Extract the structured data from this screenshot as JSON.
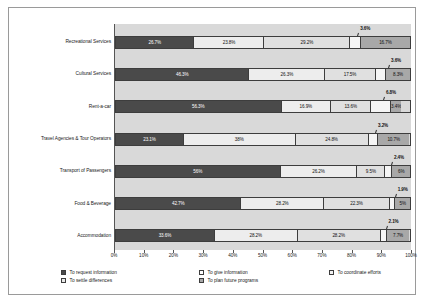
{
  "chart_data": {
    "type": "bar",
    "orientation": "horizontal",
    "stacked": true,
    "title": "",
    "xlabel": "",
    "ylabel": "",
    "xlim": [
      0,
      100
    ],
    "grid": false,
    "legend_position": "bottom",
    "axis_ticks": [
      "0%",
      "10%",
      "20%",
      "30%",
      "40%",
      "50%",
      "60%",
      "70%",
      "80%",
      "90%",
      "100%"
    ],
    "tick_values": [
      0,
      10,
      20,
      30,
      40,
      50,
      60,
      70,
      80,
      90,
      100
    ],
    "categories": [
      "Recreational Services",
      "Cultural Services",
      "Rent-a-car",
      "Travel Agencies & Tour Operators",
      "Transport of Passengers",
      "Food & Beverage",
      "Accommodation"
    ],
    "series": [
      {
        "name": "To request information",
        "color": "#4a4a4a",
        "values": [
          26.7,
          46.3,
          56.3,
          23.1,
          56.0,
          42.7,
          33.6
        ],
        "labels": [
          "26.7%",
          "46.3%",
          "56.3%",
          "23.1%",
          "56%",
          "42.7%",
          "33.6%"
        ]
      },
      {
        "name": "To give information",
        "color": "#ededed",
        "values": [
          23.8,
          26.3,
          16.9,
          38.0,
          26.2,
          28.2,
          28.2
        ],
        "labels": [
          "23.8%",
          "26.3%",
          "16.9%",
          "38%",
          "26.2%",
          "28.2%",
          "28.2%"
        ]
      },
      {
        "name": "To coordinate efforts",
        "color": "#e0e0e0",
        "values": [
          29.2,
          17.5,
          13.6,
          24.8,
          9.5,
          22.3,
          28.2
        ],
        "labels": [
          "29.2%",
          "17.5%",
          "13.6%",
          "24.8%",
          "9.5%",
          "22.3%",
          "28.2%"
        ]
      },
      {
        "name": "To settle differences",
        "color": "#f5f5f5",
        "values": [
          3.6,
          3.6,
          6.8,
          3.2,
          2.4,
          1.9,
          2.1
        ],
        "labels": [
          "3.6%",
          "3.6%",
          "6.8%",
          "3.2%",
          "2.4%",
          "1.9%",
          "2.1%"
        ],
        "labels_as_callouts": true
      },
      {
        "name": "To plan future programs",
        "color": "#a8a8a8",
        "values": [
          16.7,
          8.3,
          3.4,
          10.7,
          6.0,
          5.0,
          7.7
        ],
        "labels": [
          "16.7%",
          "8.3%",
          "3.4%",
          "10.7%",
          "6%",
          "5%",
          "7.7%"
        ]
      }
    ]
  },
  "legend": {
    "items": [
      "To request information",
      "To settle differences",
      "To give information",
      "To plan future programs",
      "To coordinate efforts"
    ]
  }
}
